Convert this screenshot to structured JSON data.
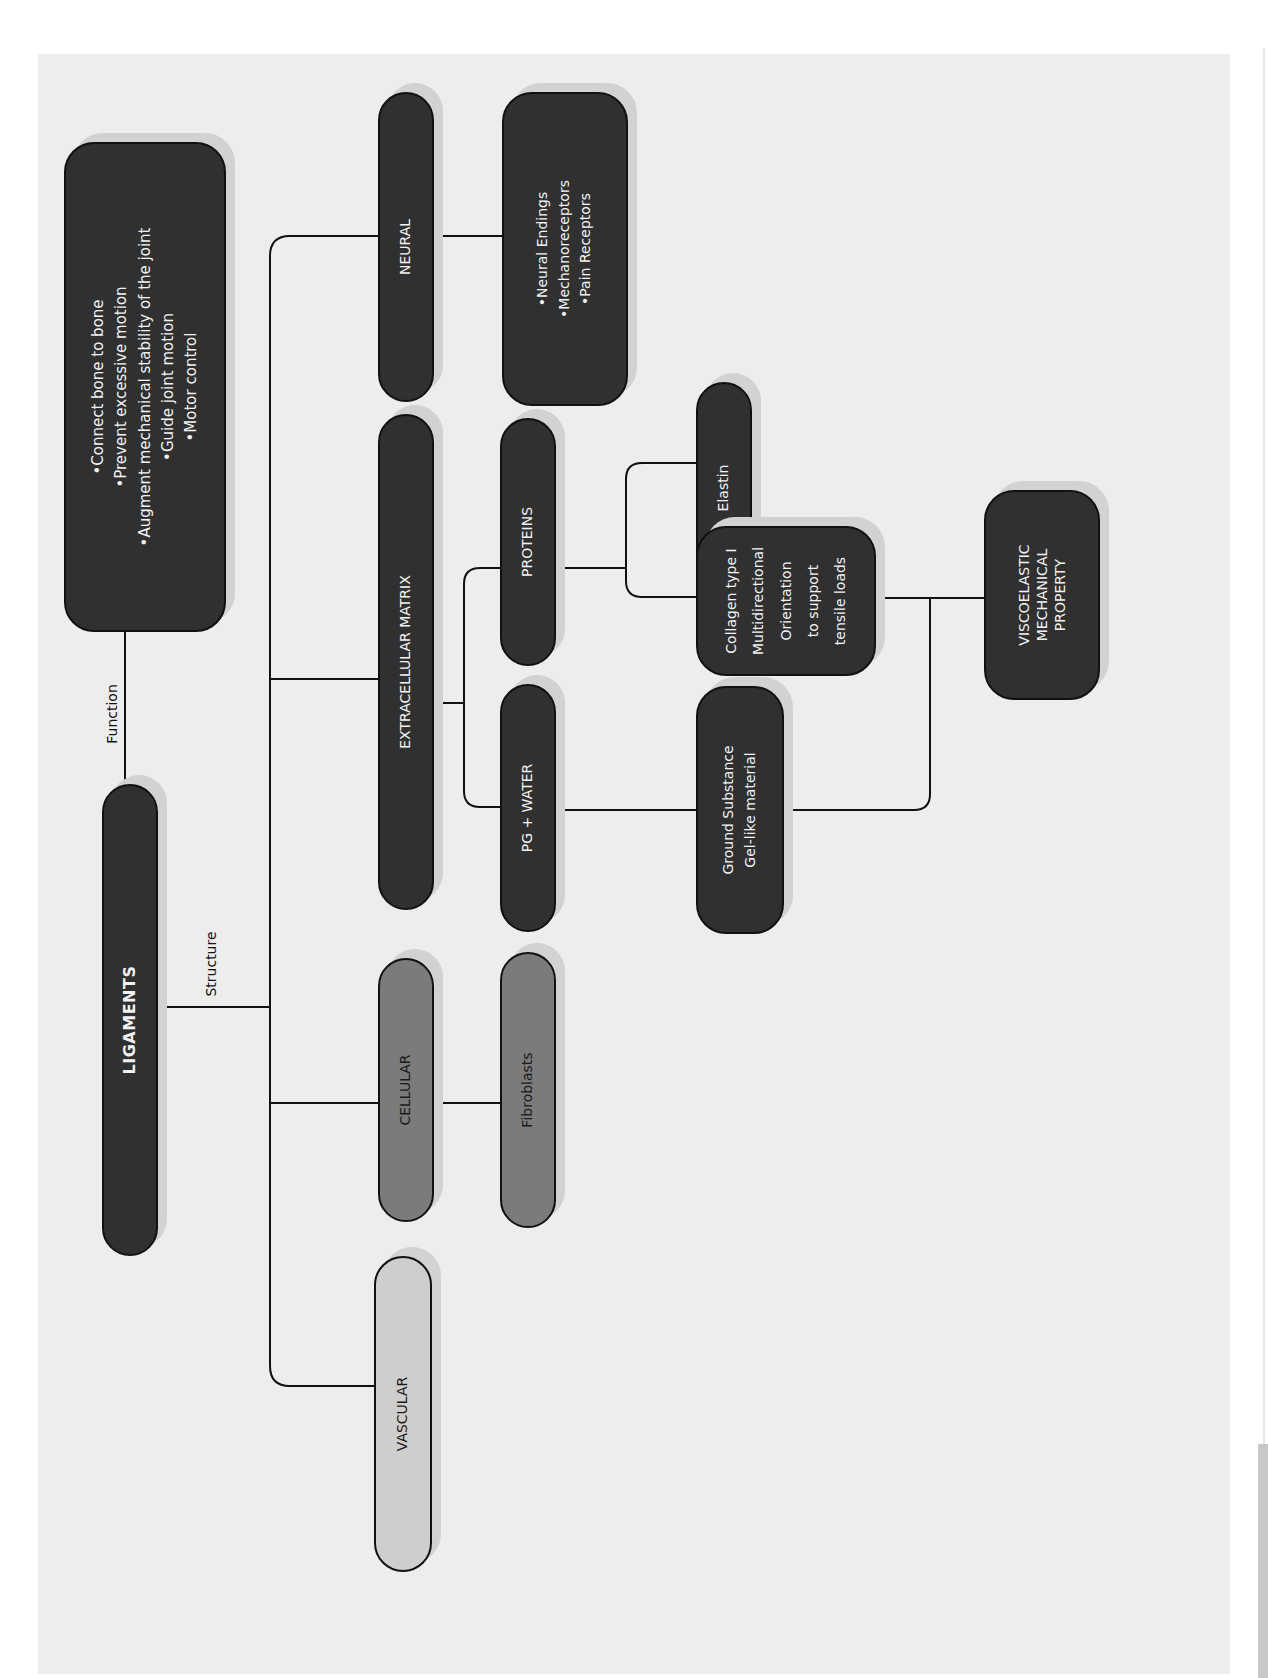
{
  "diagram": {
    "title": "LIGAMENTS",
    "orientation": "rotated -90deg (reads bottom-to-top)",
    "edge_labels": {
      "function": "Function",
      "structure": "Structure"
    },
    "function_box": {
      "lines": [
        "•Connect bone to bone",
        "•Prevent excessive motion",
        "•Augment mechanical stability of the joint",
        "•Guide joint motion",
        "•Motor control"
      ]
    },
    "structure": {
      "neural": {
        "label": "NEURAL",
        "children": {
          "lines": [
            "•Neural Endings",
            "•Mechanoreceptors",
            "•Pain Receptors"
          ]
        }
      },
      "extracellular_matrix": {
        "label": "EXTRACELLULAR MATRIX",
        "proteins": {
          "label": "PROTEINS",
          "elastin": "Elastin",
          "collagen": {
            "lines": [
              "Collagen type I",
              "Multidirectional",
              "Orientation",
              "to support",
              "tensile loads"
            ]
          }
        },
        "pg_water": {
          "label": "PG + WATER",
          "ground_substance": {
            "lines": [
              "Ground Substance",
              "Gel-like material"
            ]
          }
        }
      },
      "cellular": {
        "label": "CELLULAR",
        "fibroblasts": "Fibroblasts"
      },
      "vascular": {
        "label": "VASCULAR"
      }
    },
    "outcome": {
      "lines": [
        "VISCOELASTIC",
        "MECHANICAL",
        "PROPERTY"
      ]
    }
  },
  "colors": {
    "background": "#ededed",
    "dark_node": "#303030",
    "mid_node": "#7b7b7b",
    "light_node": "#cecece",
    "shadow": "#d2d2d2",
    "line": "#111111"
  }
}
